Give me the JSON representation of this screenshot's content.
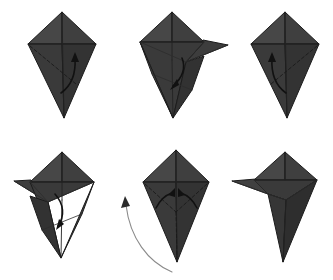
{
  "document": {
    "title": "Origami folding instruction diagram",
    "type": "step-by-step fold sequence",
    "background_color": "#ffffff",
    "panel_count": 6,
    "rows": 2,
    "columns": 3
  },
  "palette": {
    "paper_light": "#4a4a4a",
    "paper_mid": "#414141",
    "paper_dark": "#383838",
    "paper_darker": "#323232",
    "paper_deepest": "#2b2b2b",
    "outline": "#1c1c1c",
    "crease_line": "#232323",
    "valley_fold_dash": "#1a1a1a",
    "action_arrow": "#111111",
    "flip_arrow": "#8a8a8a",
    "background": "#ffffff"
  },
  "panels": [
    {
      "id": "panel-1",
      "step_number": 1,
      "position": "top-left",
      "base_shape": "kite-base",
      "description": "Kite base with vertical and horizontal creases; dashed valley fold on the lower-left face with a curved arrow indicating fold to the right.",
      "fold_type": "valley-fold",
      "arrows": [
        {
          "name": "fold-arrow-right",
          "direction": "up-right",
          "style": "solid-black-curved"
        }
      ]
    },
    {
      "id": "panel-2",
      "step_number": 2,
      "position": "top-center",
      "base_shape": "kite-base-with-flap",
      "description": "The lower-left flap has been swung out to the right forming a sharp horizontal point; arrow shows it being folded down.",
      "fold_type": "swing-flap-right",
      "arrows": [
        {
          "name": "fold-arrow-down",
          "direction": "down",
          "style": "solid-black-curved"
        }
      ]
    },
    {
      "id": "panel-3",
      "step_number": 3,
      "position": "top-right",
      "base_shape": "kite-base",
      "description": "Mirror of step 1: dashed valley fold on the lower-right face with a curved arrow indicating fold to the left.",
      "fold_type": "valley-fold",
      "arrows": [
        {
          "name": "fold-arrow-left",
          "direction": "up-left",
          "style": "solid-black-curved"
        }
      ]
    },
    {
      "id": "panel-4",
      "step_number": 4,
      "position": "bottom-left",
      "base_shape": "kite-base-with-flap",
      "description": "Mirror of step 2: the flap has been swung out to the left forming a sharp horizontal point; arrow shows it being folded down.",
      "fold_type": "swing-flap-left",
      "arrows": [
        {
          "name": "fold-arrow-down",
          "direction": "down",
          "style": "solid-black-curved"
        }
      ]
    },
    {
      "id": "panel-5",
      "step_number": 5,
      "position": "bottom-center",
      "base_shape": "kite-base-symmetric",
      "description": "Symmetric dashed valley folds on both lower faces with two small inward arrows; a large sweeping gray arrow at the left indicates turning the model over.",
      "fold_type": "valley-fold-both-sides",
      "arrows": [
        {
          "name": "fold-arrow-inward-left",
          "direction": "up",
          "style": "solid-black-curved"
        },
        {
          "name": "fold-arrow-inward-right",
          "direction": "up",
          "style": "solid-black-curved"
        },
        {
          "name": "turn-over-arrow",
          "direction": "counter-clockwise-sweep",
          "style": "thin-gray-curved"
        }
      ]
    },
    {
      "id": "panel-6",
      "step_number": 6,
      "position": "bottom-right",
      "base_shape": "completed-form",
      "description": "Finished shape: a bird-like form with a narrow pointed beak projecting to the left and a tapered body below.",
      "fold_type": "result",
      "arrows": []
    }
  ]
}
